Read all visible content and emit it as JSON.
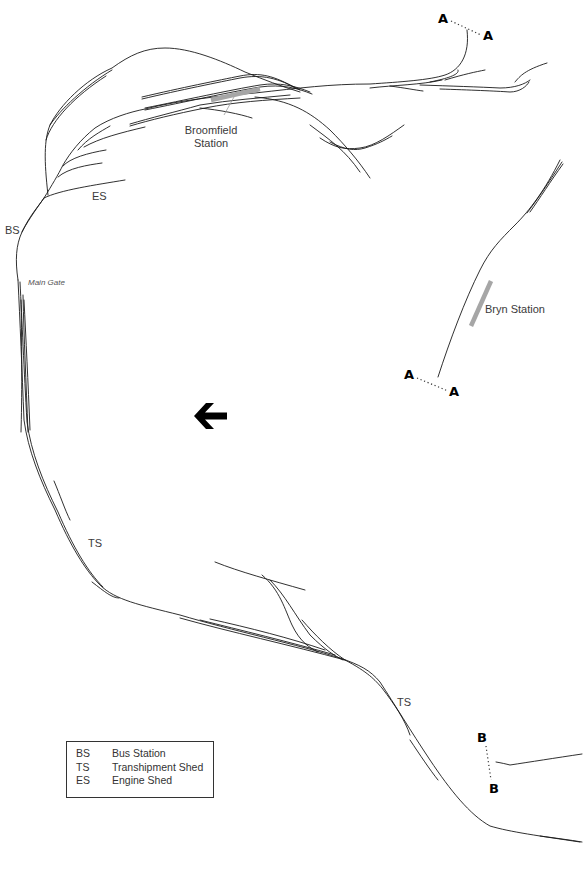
{
  "map": {
    "type": "railway track schematic",
    "direction_arrow": "arrow-left",
    "labels": {
      "broomfield_station": [
        "Broomfield",
        "Station"
      ],
      "bryn_station": "Bryn Station",
      "main_gate": "Main Gate",
      "bs": "BS",
      "es": "ES",
      "ts_1": "TS",
      "ts_2": "TS"
    },
    "connectors": {
      "a_top_left": "A",
      "a_top_right": "A",
      "a_mid_left": "A",
      "a_mid_right": "A",
      "b_top": "B",
      "b_bottom": "B"
    }
  },
  "legend": {
    "items": [
      {
        "abbr": "BS",
        "meaning": "Bus Station"
      },
      {
        "abbr": "TS",
        "meaning": "Transhipment Shed"
      },
      {
        "abbr": "ES",
        "meaning": "Engine Shed"
      }
    ]
  },
  "colors": {
    "track": "#1a1a1a",
    "platform": "#a6a6a6",
    "background": "#ffffff"
  }
}
